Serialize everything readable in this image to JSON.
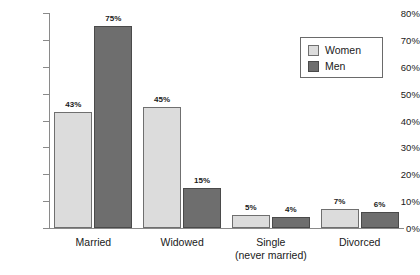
{
  "chart_data": {
    "type": "bar",
    "title": "",
    "subtitle": "",
    "xlabel": "",
    "ylabel": "",
    "ylim": [
      0,
      80
    ],
    "ytick_labels": [
      "0%",
      "10%",
      "20%",
      "30%",
      "40%",
      "50%",
      "60%",
      "70%",
      "80%"
    ],
    "ytick_values": [
      0,
      10,
      20,
      30,
      40,
      50,
      60,
      70,
      80
    ],
    "grid": false,
    "legend_position": "top-right",
    "categories": [
      "Married",
      "Widowed",
      "Single (never married)",
      "Divorced"
    ],
    "category_labels": [
      {
        "line1": "Married",
        "line2": ""
      },
      {
        "line1": "Widowed",
        "line2": ""
      },
      {
        "line1": "Single",
        "line2": "(never married)"
      },
      {
        "line1": "Divorced",
        "line2": ""
      }
    ],
    "series": [
      {
        "name": "Women",
        "color": "#dcdcdc",
        "values": [
          43,
          45,
          5,
          7
        ],
        "data_labels": [
          "43%",
          "45%",
          "5%",
          "7%"
        ]
      },
      {
        "name": "Men",
        "color": "#6e6e6e",
        "values": [
          75,
          15,
          4,
          6
        ],
        "data_labels": [
          "75%",
          "15%",
          "4%",
          "6%"
        ]
      }
    ]
  },
  "legend": {
    "items": [
      {
        "label": "Women",
        "color": "#dcdcdc"
      },
      {
        "label": "Men",
        "color": "#6e6e6e"
      }
    ]
  },
  "colors": {
    "women": "#dcdcdc",
    "men": "#6e6e6e",
    "axis": "#8a8a8a",
    "text": "#1a1a1a",
    "background": "#ffffff"
  }
}
